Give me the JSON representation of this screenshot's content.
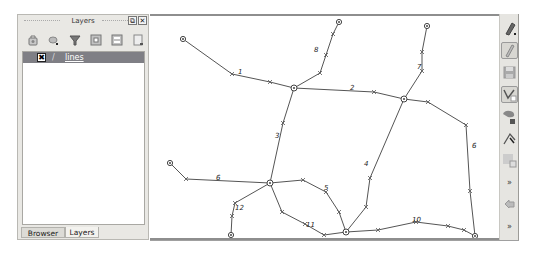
{
  "layers_panel": {
    "title": "Layers",
    "float_button": "⧉",
    "close_button": "✕",
    "toolbar_icons": [
      "open-layer-styling-icon",
      "add-group-icon",
      "filter-legend-icon",
      "expand-all-icon",
      "collapse-all-icon",
      "remove-layer-icon"
    ],
    "layers": [
      {
        "name": "lines",
        "visible_check": "✖",
        "symbol": "/",
        "checked": true
      }
    ],
    "tabs": [
      {
        "label": "Browser",
        "active": false
      },
      {
        "label": "Layers",
        "active": true
      }
    ]
  },
  "right_toolbar": {
    "buttons": [
      {
        "name": "toggle-editing",
        "pressed": false
      },
      {
        "name": "current-edits",
        "pressed": true
      },
      {
        "name": "save-edits",
        "pressed": false
      },
      {
        "name": "add-line-feature",
        "pressed": true
      },
      {
        "name": "move-feature",
        "pressed": false
      },
      {
        "name": "node-tool",
        "pressed": false
      },
      {
        "name": "delete-selected",
        "pressed": false
      },
      {
        "name": "more-1",
        "label": "»"
      },
      {
        "name": "undo",
        "pressed": false
      },
      {
        "name": "more-2",
        "label": "»"
      }
    ]
  },
  "map": {
    "colors": {
      "line": "#555555",
      "node": "#444444",
      "label": "#222222"
    },
    "lines": [
      {
        "id": "1",
        "label": "1",
        "points": [
          [
            33,
            23
          ],
          [
            82,
            58
          ],
          [
            120,
            66
          ],
          [
            144,
            72
          ]
        ],
        "label_pos": [
          88,
          58
        ]
      },
      {
        "id": "2",
        "label": "2",
        "points": [
          [
            144,
            72
          ],
          [
            224,
            76
          ],
          [
            254,
            83
          ]
        ],
        "label_pos": [
          200,
          74
        ]
      },
      {
        "id": "3",
        "label": "3",
        "points": [
          [
            144,
            72
          ],
          [
            133,
            107
          ],
          [
            120,
            167
          ]
        ],
        "label_pos": [
          125,
          122
        ]
      },
      {
        "id": "4",
        "label": "4",
        "points": [
          [
            254,
            83
          ],
          [
            220,
            162
          ],
          [
            216,
            191
          ],
          [
            196,
            216
          ]
        ],
        "label_pos": [
          214,
          150
        ]
      },
      {
        "id": "5",
        "label": "5",
        "points": [
          [
            120,
            167
          ],
          [
            153,
            164
          ],
          [
            176,
            176
          ],
          [
            189,
            196
          ],
          [
            196,
            216
          ]
        ],
        "label_pos": [
          174,
          174
        ]
      },
      {
        "id": "6",
        "label": "6",
        "points": [
          [
            20,
            147
          ],
          [
            36,
            163
          ],
          [
            120,
            167
          ]
        ],
        "label_pos": [
          66,
          164
        ]
      },
      {
        "id": "6b",
        "label": "6",
        "points": [
          [
            254,
            83
          ],
          [
            278,
            86
          ],
          [
            316,
            109
          ],
          [
            320,
            175
          ],
          [
            325,
            220
          ]
        ],
        "label_pos": [
          322,
          132
        ]
      },
      {
        "id": "7",
        "label": "7",
        "points": [
          [
            277,
            10
          ],
          [
            272,
            36
          ],
          [
            272,
            55
          ],
          [
            254,
            83
          ]
        ],
        "label_pos": [
          267,
          53
        ]
      },
      {
        "id": "8",
        "label": "8",
        "points": [
          [
            189,
            6
          ],
          [
            183,
            18
          ],
          [
            176,
            39
          ],
          [
            170,
            57
          ],
          [
            144,
            72
          ]
        ],
        "label_pos": [
          164,
          36
        ]
      },
      {
        "id": "10",
        "label": "10",
        "points": [
          [
            196,
            216
          ],
          [
            228,
            214
          ],
          [
            266,
            206
          ],
          [
            298,
            210
          ],
          [
            314,
            214
          ],
          [
            325,
            220
          ]
        ],
        "label_pos": [
          262,
          206
        ]
      },
      {
        "id": "11",
        "label": "11",
        "points": [
          [
            120,
            167
          ],
          [
            132,
            196
          ],
          [
            155,
            208
          ],
          [
            174,
            219
          ],
          [
            196,
            216
          ]
        ],
        "label_pos": [
          156,
          211
        ]
      },
      {
        "id": "12",
        "label": "12",
        "points": [
          [
            120,
            167
          ],
          [
            85,
            187
          ],
          [
            82,
            200
          ],
          [
            81,
            219
          ]
        ],
        "label_pos": [
          85,
          194
        ]
      }
    ],
    "nodes": [
      {
        "pos": [
          33,
          23
        ],
        "type": "end"
      },
      {
        "pos": [
          189,
          6
        ],
        "type": "end"
      },
      {
        "pos": [
          277,
          10
        ],
        "type": "end"
      },
      {
        "pos": [
          144,
          72
        ],
        "type": "junction"
      },
      {
        "pos": [
          254,
          83
        ],
        "type": "junction"
      },
      {
        "pos": [
          20,
          147
        ],
        "type": "end"
      },
      {
        "pos": [
          120,
          167
        ],
        "type": "junction"
      },
      {
        "pos": [
          81,
          219
        ],
        "type": "end"
      },
      {
        "pos": [
          196,
          216
        ],
        "type": "junction"
      },
      {
        "pos": [
          325,
          220
        ],
        "type": "end"
      }
    ]
  }
}
